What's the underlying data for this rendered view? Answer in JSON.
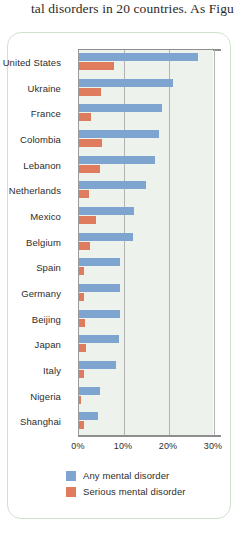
{
  "page_text_fragment": "tal disorders in 20 countries. As Figu",
  "colors": {
    "any": "#7ea5d0",
    "serious": "#df7c5e",
    "plot_background": "#edf2ec",
    "frame_border": "#cfe2cb",
    "gridline": "#b3b3b3",
    "axis": "#8e8e8e",
    "text": "#2d2d2d"
  },
  "chart_data": {
    "type": "bar",
    "orientation": "horizontal",
    "title": "",
    "xlabel": "",
    "ylabel": "",
    "xlim": [
      0,
      30
    ],
    "xticks": [
      "0%",
      "10%",
      "20%",
      "30%"
    ],
    "xtick_values": [
      0,
      10,
      20,
      30
    ],
    "grid": true,
    "legend_position": "bottom",
    "categories": [
      "United States",
      "Ukraine",
      "France",
      "Colombia",
      "Lebanon",
      "Netherlands",
      "Mexico",
      "Belgium",
      "Spain",
      "Germany",
      "Beijing",
      "Japan",
      "Italy",
      "Nigeria",
      "Shanghai"
    ],
    "series": [
      {
        "name": "Any mental disorder",
        "color": "#7ea5d0",
        "values": [
          26.4,
          20.8,
          18.4,
          17.8,
          16.9,
          14.9,
          12.2,
          12.0,
          9.2,
          9.1,
          9.1,
          8.8,
          8.2,
          4.7,
          4.3
        ]
      },
      {
        "name": "Serious mental disorder",
        "color": "#df7c5e",
        "values": [
          7.7,
          4.8,
          2.7,
          5.2,
          4.6,
          2.3,
          3.7,
          2.4,
          1.0,
          1.2,
          1.3,
          1.5,
          1.0,
          0.4,
          1.2
        ]
      }
    ]
  },
  "legend": {
    "items": [
      {
        "label": "Any mental disorder",
        "color": "#7ea5d0"
      },
      {
        "label": "Serious mental disorder",
        "color": "#df7c5e"
      }
    ]
  }
}
